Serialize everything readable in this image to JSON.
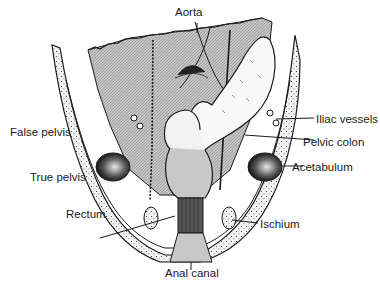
{
  "diagram": {
    "type": "anatomical-illustration",
    "labels": {
      "aorta": "Aorta",
      "false_pelvis": "False pelvis",
      "true_pelvis": "True pelvis",
      "rectum": "Rectum",
      "iliac_vessels": "Iliac vessels",
      "pelvic_colon": "Pelvic colon",
      "acetabulum": "Acetabulum",
      "ischium": "Ischium",
      "anal_canal": "Anal canal"
    },
    "colors": {
      "ink": "#1a1a1a",
      "shade": "#b8b8b8",
      "paper": "#ffffff"
    }
  }
}
